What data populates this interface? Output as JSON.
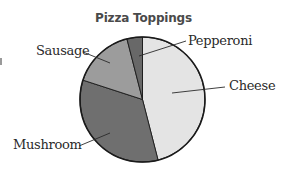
{
  "chart_data": {
    "type": "pie",
    "title": "Pizza Toppings",
    "categories": [
      "Cheese",
      "Mushroom",
      "Sausage",
      "Pepperoni"
    ],
    "values": [
      46,
      34,
      16,
      4
    ],
    "unit": "percent (estimated from slice angles)",
    "start_angle_deg": 0,
    "direction": "clockwise",
    "legend": "none (direct labels with leader lines)",
    "colors": [
      "#e4e4e4",
      "#6f6f6f",
      "#9c9c9c",
      "#686868"
    ],
    "grid": false
  },
  "labels": {
    "cheese": "Cheese",
    "mushroom": "Mushroom",
    "sausage": "Sausage",
    "pepperoni": "Pepperoni"
  },
  "colors": {
    "outline": "#1a1a1a",
    "leader_line": "#2a2a2a",
    "title": "#4a4a4a"
  }
}
